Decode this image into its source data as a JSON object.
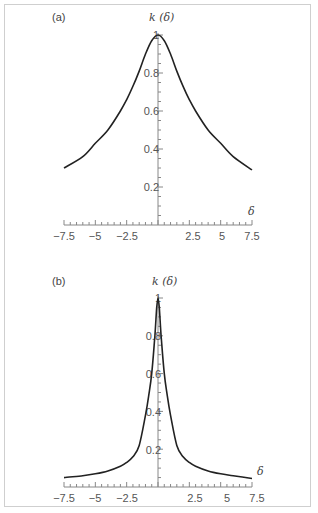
{
  "chart_data": [
    {
      "type": "line",
      "panel_label": "(a)",
      "title": "",
      "xlabel": "δ",
      "ylabel": "k (δ)",
      "xlim": [
        -7.5,
        7.5
      ],
      "ylim": [
        0,
        1
      ],
      "xticks": [
        -7.5,
        -5,
        -2.5,
        2.5,
        5,
        7.5
      ],
      "xtick_labels": [
        "−7.5",
        "−5",
        "−2.5",
        "2.5",
        "5",
        "7.5"
      ],
      "yticks": [
        0.2,
        0.4,
        0.6,
        0.8,
        1
      ],
      "ytick_labels": [
        "0.2",
        "0.4",
        "0.6",
        "0.8",
        "1"
      ],
      "grid": false,
      "legend": null,
      "series": [
        {
          "name": "k(δ)",
          "color": "#222222",
          "x": [
            -7.5,
            -6,
            -5,
            -4,
            -3,
            -2.5,
            -2,
            -1.5,
            -1,
            -0.5,
            0,
            0.5,
            1,
            1.5,
            2,
            2.5,
            3,
            4,
            5,
            6,
            7.5
          ],
          "y": [
            0.3,
            0.36,
            0.43,
            0.5,
            0.6,
            0.66,
            0.73,
            0.81,
            0.9,
            0.97,
            1.0,
            0.97,
            0.9,
            0.81,
            0.73,
            0.66,
            0.6,
            0.5,
            0.43,
            0.36,
            0.29
          ]
        }
      ]
    },
    {
      "type": "line",
      "panel_label": "(b)",
      "title": "",
      "xlabel": "δ",
      "ylabel": "k (δ)",
      "xlim": [
        -7.5,
        7.5
      ],
      "ylim": [
        0,
        1
      ],
      "xticks": [
        -7.5,
        -5,
        -2.5,
        2.5,
        5,
        7.5
      ],
      "xtick_labels": [
        "−7.5",
        "−5",
        "−2.5",
        "2.5",
        "5",
        "7.5"
      ],
      "yticks": [
        0.2,
        0.4,
        0.6,
        0.8,
        1
      ],
      "ytick_labels": [
        "0.2",
        "0.4",
        "0.6",
        "0.8",
        "1"
      ],
      "grid": false,
      "legend": null,
      "series": [
        {
          "name": "k(δ)",
          "color": "#222222",
          "x": [
            -7.5,
            -6,
            -5,
            -4,
            -3,
            -2.5,
            -2,
            -1.5,
            -1,
            -0.75,
            -0.5,
            -0.25,
            -0.1,
            0,
            0.1,
            0.25,
            0.5,
            0.75,
            1,
            1.5,
            2,
            2.5,
            3,
            4,
            5,
            6,
            7.5
          ],
          "y": [
            0.05,
            0.06,
            0.07,
            0.085,
            0.11,
            0.13,
            0.16,
            0.22,
            0.38,
            0.48,
            0.6,
            0.8,
            0.95,
            1.0,
            0.95,
            0.8,
            0.6,
            0.48,
            0.38,
            0.22,
            0.16,
            0.13,
            0.11,
            0.085,
            0.07,
            0.06,
            0.045
          ]
        }
      ]
    }
  ]
}
